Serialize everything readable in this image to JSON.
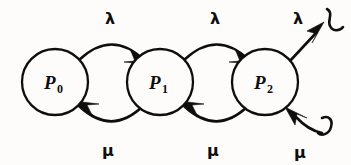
{
  "diagram": {
    "type": "state-transition-diagram",
    "background_color": "#fdfcfb",
    "ink_color": "#100e0c",
    "states": [
      {
        "id": "p0",
        "base": "P",
        "subscript": "0",
        "cx": 55,
        "cy": 82,
        "r": 33
      },
      {
        "id": "p1",
        "base": "P",
        "subscript": "1",
        "cx": 160,
        "cy": 82,
        "r": 33
      },
      {
        "id": "p2",
        "base": "P",
        "subscript": "2",
        "cx": 265,
        "cy": 82,
        "r": 33
      }
    ],
    "transitions": [
      {
        "id": "t-p0-p1",
        "label": "λ",
        "direction": "forward",
        "from": "p0",
        "to": "p1",
        "label_x": 110,
        "label_y": 24
      },
      {
        "id": "t-p1-p2",
        "label": "λ",
        "direction": "forward",
        "from": "p1",
        "to": "p2",
        "label_x": 215,
        "label_y": 24
      },
      {
        "id": "t-p2-out",
        "label": "λ",
        "direction": "forward",
        "from": "p2",
        "to": "open",
        "label_x": 298,
        "label_y": 24
      },
      {
        "id": "t-p1-p0",
        "label": "μ",
        "direction": "backward",
        "from": "p1",
        "to": "p0",
        "label_x": 108,
        "label_y": 156
      },
      {
        "id": "t-p2-p1",
        "label": "μ",
        "direction": "backward",
        "from": "p2",
        "to": "p1",
        "label_x": 213,
        "label_y": 156
      },
      {
        "id": "t-in-p2",
        "label": "μ",
        "direction": "backward",
        "from": "open",
        "to": "p2",
        "label_x": 300,
        "label_y": 158
      }
    ],
    "open_terminators": [
      {
        "id": "top-right-squiggle",
        "position": "top-right"
      },
      {
        "id": "bottom-right-squiggle",
        "position": "bottom-right"
      }
    ]
  }
}
